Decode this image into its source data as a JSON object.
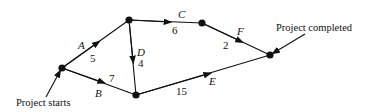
{
  "diagram": {
    "type": "activity-network",
    "nodes": [
      {
        "id": "n1",
        "x": 62,
        "y": 68
      },
      {
        "id": "n2",
        "x": 129,
        "y": 20
      },
      {
        "id": "n3",
        "x": 136,
        "y": 95
      },
      {
        "id": "n4",
        "x": 202,
        "y": 23
      },
      {
        "id": "n5",
        "x": 270,
        "y": 55
      }
    ],
    "edges": [
      {
        "activity": "A",
        "duration": "5",
        "from": "n1",
        "to": "n2"
      },
      {
        "activity": "B",
        "duration": "7",
        "from": "n1",
        "to": "n3"
      },
      {
        "activity": "C",
        "duration": "6",
        "from": "n2",
        "to": "n4"
      },
      {
        "activity": "D",
        "duration": "4",
        "from": "n2",
        "to": "n3"
      },
      {
        "activity": "E",
        "duration": "15",
        "from": "n3",
        "to": "n5"
      },
      {
        "activity": "F",
        "duration": "2",
        "from": "n4",
        "to": "n5"
      }
    ],
    "annotations": {
      "start": "Project starts",
      "end": "Project completed"
    }
  }
}
